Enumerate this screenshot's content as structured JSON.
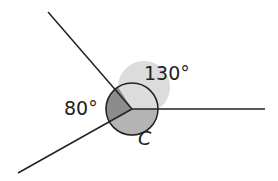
{
  "diagram": {
    "labels": {
      "angle_a": "130°",
      "angle_b": "80°",
      "angle_c": "C"
    },
    "colors": {
      "light": "#dcdcdc",
      "dark": "#8c8c8c",
      "mid": "#b4b4b4",
      "line": "#222222"
    }
  }
}
